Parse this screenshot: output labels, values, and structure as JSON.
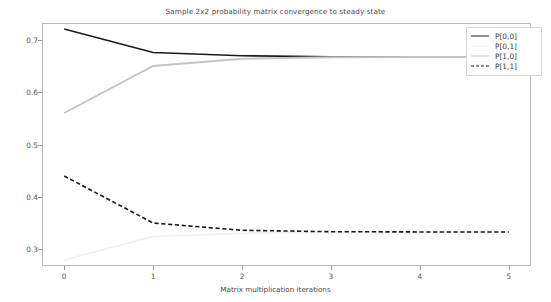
{
  "chart_data": {
    "type": "line",
    "title": "Sample 2x2 probability matrix convergence to steady state",
    "xlabel": "Matrix multiplication iterations",
    "ylabel": "",
    "x": [
      0,
      1,
      2,
      3,
      4,
      5
    ],
    "xlim": [
      -0.25,
      5.25
    ],
    "ylim": [
      0.2685,
      0.7315
    ],
    "xticks": [
      "0",
      "1",
      "2",
      "3",
      "4",
      "5"
    ],
    "yticks": [
      "0.3",
      "0.4",
      "0.5",
      "0.6",
      "0.7"
    ],
    "ytick_values": [
      0.3,
      0.4,
      0.5,
      0.6,
      0.7
    ],
    "grid": false,
    "legend_position": "upper right",
    "series": [
      {
        "name": "P[0,0]",
        "values": [
          0.72,
          0.6752,
          0.6692,
          0.6672,
          0.6669,
          0.6667
        ],
        "color": "#1a1a1a",
        "linestyle": "solid",
        "linewidth": 1.6
      },
      {
        "name": "P[0,1]",
        "values": [
          0.28,
          0.3248,
          0.3308,
          0.3328,
          0.3331,
          0.3333
        ],
        "color": "#f0f0f0",
        "linestyle": "solid",
        "linewidth": 1.6
      },
      {
        "name": "P[1,0]",
        "values": [
          0.56,
          0.6496,
          0.6635,
          0.6661,
          0.6666,
          0.6667
        ],
        "color": "#c4c4c4",
        "linestyle": "solid",
        "linewidth": 1.9
      },
      {
        "name": "P[1,1]",
        "values": [
          0.44,
          0.3504,
          0.3365,
          0.3339,
          0.3334,
          0.3333
        ],
        "color": "#1a1a1a",
        "linestyle": "dashed",
        "linewidth": 1.6
      }
    ]
  },
  "figure": {
    "background_color": "#ffffff",
    "frame_color": "#b8b8b8",
    "tick_color": "#9a9a9a",
    "text_color": "#4a4a4a"
  }
}
